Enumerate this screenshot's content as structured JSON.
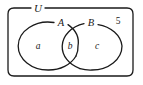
{
  "figure": {
    "type": "venn-diagram",
    "sets": 2,
    "colors": {
      "stroke": "#1a1a1a",
      "background": "#ffffff",
      "text": "#1a1a1a"
    }
  },
  "universe": {
    "label": "U",
    "outside_count": "5"
  },
  "sets": [
    {
      "id": "A",
      "label": "A",
      "side": "left"
    },
    {
      "id": "B",
      "label": "B",
      "side": "right"
    }
  ],
  "regions": [
    {
      "id": "a",
      "label": "a",
      "meaning": "A only"
    },
    {
      "id": "b",
      "label": "b",
      "meaning": "A intersect B"
    },
    {
      "id": "c",
      "label": "c",
      "meaning": "B only"
    }
  ]
}
